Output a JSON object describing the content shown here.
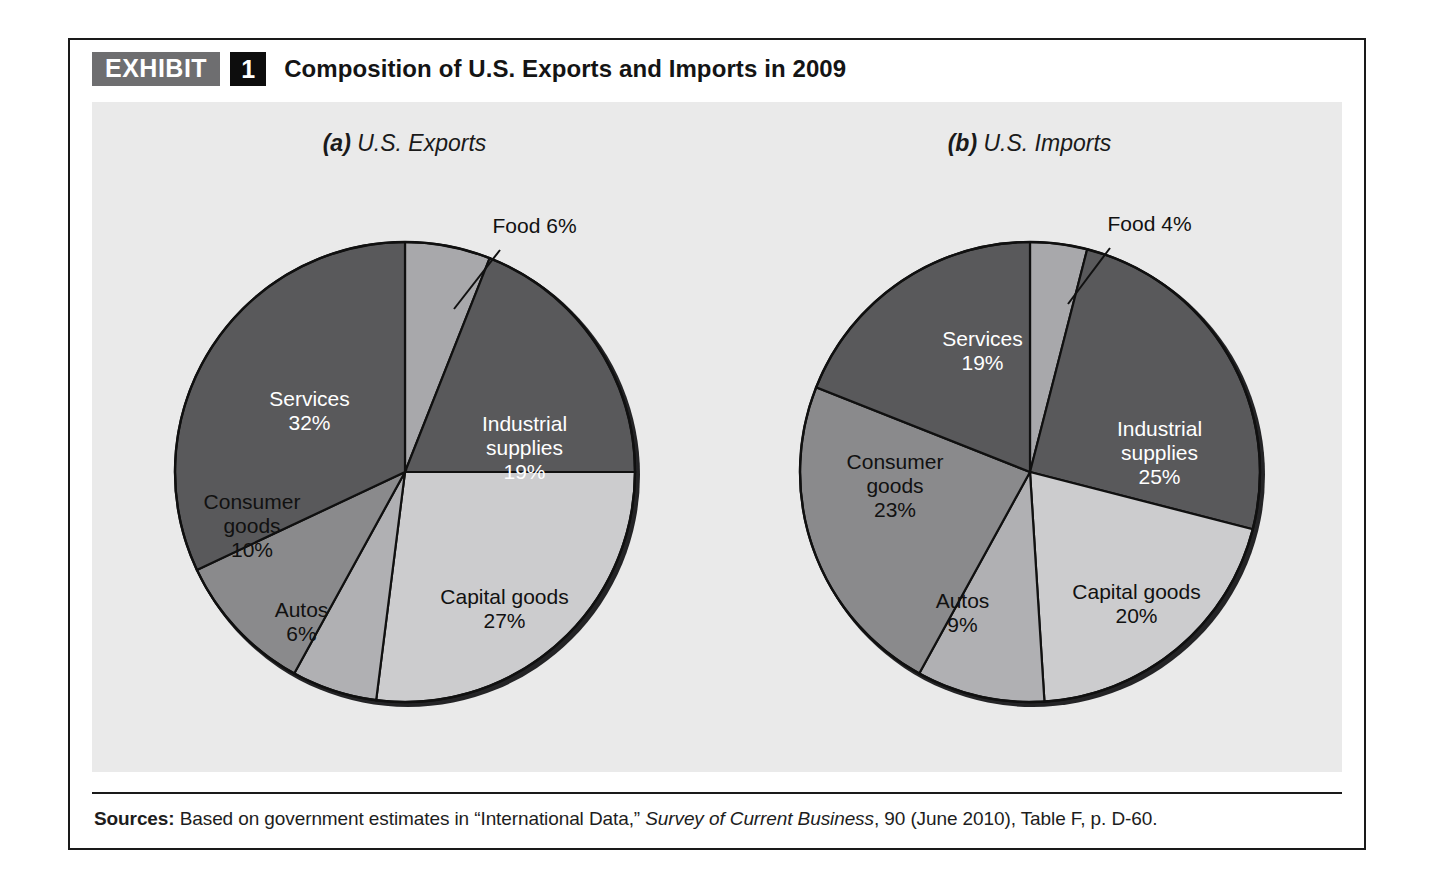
{
  "exhibit": {
    "badge_label": "EXHIBIT",
    "number": "1",
    "title": "Composition of U.S. Exports and Imports in 2009"
  },
  "source": {
    "label": "Sources:",
    "text_before": " Based on government estimates in “International Data,” ",
    "italic_part": "Survey of Current Business",
    "text_after": ", 90 (June 2010), Table F, p. D-60."
  },
  "colors": {
    "panel_bg": "#eaeaea",
    "services": "#59595b",
    "food": "#a8a8ab",
    "industrial_supplies": "#59595b",
    "capital_goods": "#ccccce",
    "autos": "#b0b0b3",
    "consumer_goods": "#8a8a8c",
    "slice_stroke": "#101010",
    "badge_gray": "#6e6e70",
    "badge_black": "#0d0d0d"
  },
  "charts": [
    {
      "id": "exports",
      "subtitle_prefix": "(a)",
      "subtitle_text": " U.S. Exports",
      "labels": {
        "services": "Services",
        "services_pct": "32%",
        "industrial": "Industrial",
        "industrial2": "supplies",
        "industrial_pct": "19%",
        "capital": "Capital goods",
        "capital_pct": "27%",
        "autos": "Autos",
        "autos_pct": "6%",
        "consumer": "Consumer",
        "consumer2": "goods",
        "consumer_pct": "10%",
        "food_callout": "Food 6%"
      }
    },
    {
      "id": "imports",
      "subtitle_prefix": "(b)",
      "subtitle_text": " U.S. Imports",
      "labels": {
        "services": "Services",
        "services_pct": "19%",
        "industrial": "Industrial",
        "industrial2": "supplies",
        "industrial_pct": "25%",
        "capital": "Capital goods",
        "capital_pct": "20%",
        "autos": "Autos",
        "autos_pct": "9%",
        "consumer": "Consumer",
        "consumer2": "goods",
        "consumer_pct": "23%",
        "food_callout": "Food 4%"
      }
    }
  ],
  "chart_data": [
    {
      "type": "pie",
      "title": "(a) U.S. Exports",
      "labels": [
        "Food",
        "Industrial supplies",
        "Capital goods",
        "Autos",
        "Consumer goods",
        "Services"
      ],
      "values": [
        6,
        19,
        27,
        6,
        10,
        32
      ],
      "unit": "percent",
      "colors": [
        "#a8a8ab",
        "#59595b",
        "#ccccce",
        "#b0b0b3",
        "#8a8a8c",
        "#59595b"
      ],
      "start_angle_deg": 0,
      "direction": "clockwise",
      "legend": "none",
      "annotations": [
        "Food 6% (leader line to top-right slice)"
      ]
    },
    {
      "type": "pie",
      "title": "(b) U.S. Imports",
      "labels": [
        "Food",
        "Industrial supplies",
        "Capital goods",
        "Autos",
        "Consumer goods",
        "Services"
      ],
      "values": [
        4,
        25,
        20,
        9,
        23,
        19
      ],
      "unit": "percent",
      "colors": [
        "#a8a8ab",
        "#59595b",
        "#ccccce",
        "#b0b0b3",
        "#8a8a8c",
        "#59595b"
      ],
      "start_angle_deg": 0,
      "direction": "clockwise",
      "legend": "none",
      "annotations": [
        "Food 4% (leader line to top-right slice)"
      ]
    }
  ]
}
